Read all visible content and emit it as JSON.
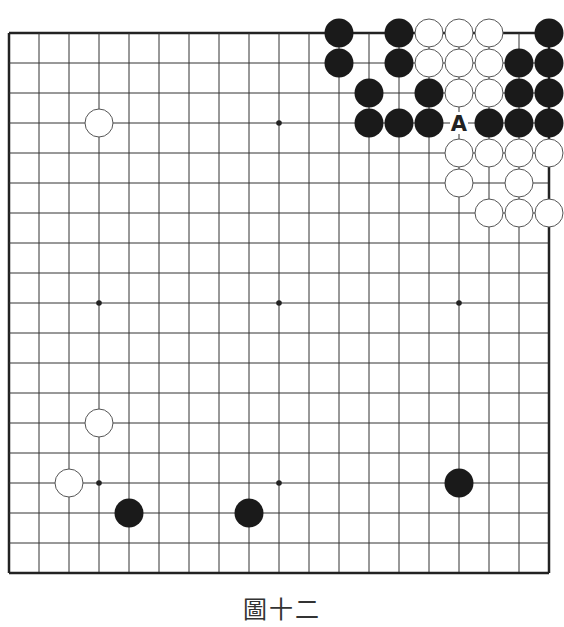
{
  "diagram": {
    "caption": "圖十二",
    "board_size": 19,
    "geometry": {
      "origin_x": 9,
      "origin_y": 33,
      "spacing": 30,
      "stone_radius": 14.5
    },
    "colors": {
      "line": "#333333",
      "border": "#222222",
      "black_stone": "#1a1a1a",
      "white_stone": "#ffffff",
      "white_outline": "#555555",
      "label": "#222222"
    },
    "star_points": [
      [
        3,
        3
      ],
      [
        9,
        3
      ],
      [
        15,
        3
      ],
      [
        3,
        9
      ],
      [
        9,
        9
      ],
      [
        15,
        9
      ],
      [
        3,
        15
      ],
      [
        9,
        15
      ],
      [
        15,
        15
      ]
    ],
    "black_stones": [
      [
        11,
        0
      ],
      [
        13,
        0
      ],
      [
        18,
        0
      ],
      [
        11,
        1
      ],
      [
        13,
        1
      ],
      [
        17,
        1
      ],
      [
        18,
        1
      ],
      [
        12,
        2
      ],
      [
        14,
        2
      ],
      [
        17,
        2
      ],
      [
        18,
        2
      ],
      [
        12,
        3
      ],
      [
        13,
        3
      ],
      [
        14,
        3
      ],
      [
        16,
        3
      ],
      [
        17,
        3
      ],
      [
        18,
        3
      ],
      [
        15,
        15
      ],
      [
        4,
        16
      ],
      [
        8,
        16
      ]
    ],
    "white_stones": [
      [
        14,
        0
      ],
      [
        15,
        0
      ],
      [
        16,
        0
      ],
      [
        14,
        1
      ],
      [
        15,
        1
      ],
      [
        16,
        1
      ],
      [
        15,
        2
      ],
      [
        16,
        2
      ],
      [
        15,
        4
      ],
      [
        16,
        4
      ],
      [
        17,
        4
      ],
      [
        18,
        4
      ],
      [
        15,
        5
      ],
      [
        17,
        5
      ],
      [
        16,
        6
      ],
      [
        17,
        6
      ],
      [
        18,
        6
      ],
      [
        3,
        3
      ],
      [
        3,
        13
      ],
      [
        2,
        15
      ]
    ],
    "labels": [
      {
        "text": "A",
        "col": 15,
        "row": 3
      }
    ]
  }
}
